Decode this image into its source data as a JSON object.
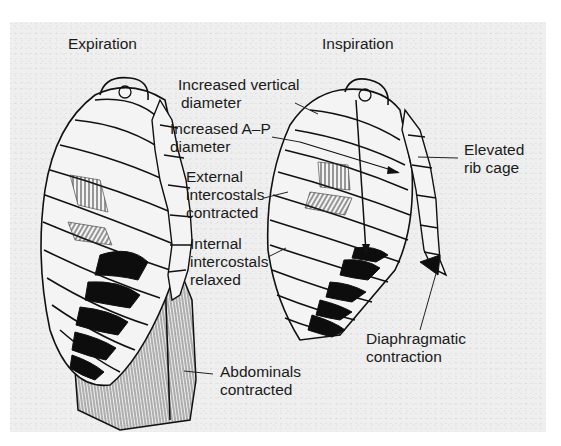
{
  "figure": {
    "panels": [
      {
        "id": "expiration",
        "title": "Expiration"
      },
      {
        "id": "inspiration",
        "title": "Inspiration"
      }
    ],
    "labels": {
      "increased_vertical": [
        "Increased vertical",
        "diameter"
      ],
      "increased_ap": [
        "Increased A–P",
        "diameter"
      ],
      "external_intercostals": [
        "External",
        "intercostals",
        "contracted"
      ],
      "internal_intercostals": [
        "Internal",
        "intercostals",
        "relaxed"
      ],
      "elevated_rib_cage": [
        "Elevated",
        "rib cage"
      ],
      "diaphragmatic": [
        "Diaphragmatic",
        "contraction"
      ],
      "abdominals": [
        "Abdominals",
        "contracted"
      ]
    },
    "colors": {
      "background": "#efefef",
      "ink": "#111111",
      "rib_fill": "#f4f4f4",
      "muscle_black": "#0d0d0d"
    }
  }
}
